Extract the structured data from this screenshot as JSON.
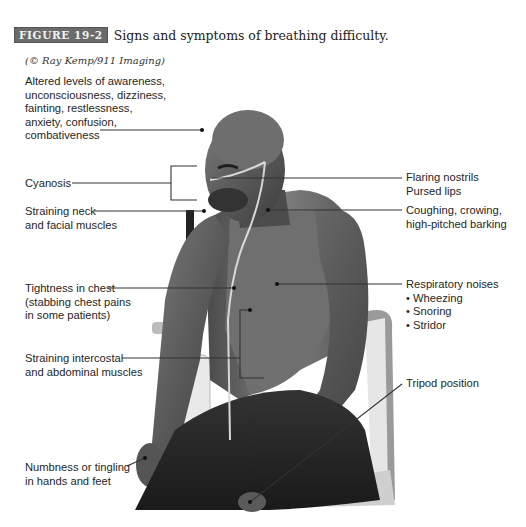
{
  "figure": {
    "badge": "FIGURE 19-2",
    "title": "Signs and symptoms of breathing difficulty.",
    "credit": "(© Ray Kemp/911 Imaging)"
  },
  "labels": {
    "awareness": {
      "lines": [
        "Altered levels of awareness,",
        "unconsciousness, dizziness,",
        "fainting, restlessness,",
        "anxiety, confusion,",
        "combativeness"
      ]
    },
    "cyanosis": {
      "lines": [
        "Cyanosis"
      ]
    },
    "straining_neck": {
      "lines": [
        "Straining neck",
        "and facial muscles"
      ]
    },
    "tightness_chest": {
      "lines": [
        "Tightness in chest",
        "(stabbing chest pains",
        "in some patients)"
      ]
    },
    "straining_intercostal": {
      "lines": [
        "Straining intercostal",
        "and abdominal muscles"
      ]
    },
    "numbness": {
      "lines": [
        "Numbness or tingling",
        "in hands and feet"
      ]
    },
    "flaring": {
      "lines": [
        "Flaring nostrils",
        "Pursed lips"
      ]
    },
    "coughing": {
      "lines": [
        "Coughing, crowing,",
        "high-pitched barking"
      ]
    },
    "respiratory": {
      "heading": "Respiratory noises",
      "items": [
        "Wheezing",
        "Snoring",
        "Stridor"
      ]
    },
    "tripod": {
      "lines": [
        "Tripod position"
      ]
    }
  },
  "colors": {
    "badge_bg": "#6b6b6b",
    "badge_text": "#f2f2f2",
    "text": "#262626",
    "leader_line": "#333333"
  }
}
